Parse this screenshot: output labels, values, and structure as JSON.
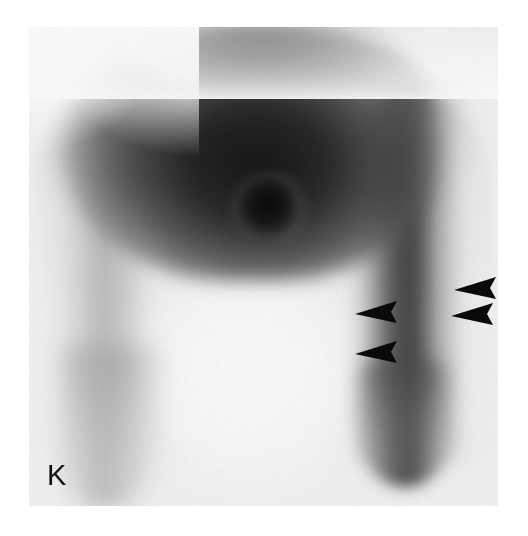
{
  "figure": {
    "panel_label": "K",
    "modality_appearance": "grayscale-scintigram",
    "background_color": "#ffffff",
    "field_background_color": "#f4f4f4",
    "ink_color": "#101010"
  },
  "scan_field": {
    "left": 29,
    "top": 27,
    "width": 469,
    "height": 479
  },
  "regions": [
    {
      "name": "upper-dark-mass",
      "description": "large high-uptake dome across the upper field",
      "center_x": 224,
      "center_y": 104,
      "intensity": "very-dark"
    },
    {
      "name": "focal-hot-spot",
      "description": "discrete focal high-uptake nodule below the dome",
      "center_x": 240,
      "center_y": 181,
      "intensity": "very-dark"
    },
    {
      "name": "right-vertical-band",
      "description": "prominent vertical band of increased activity along the right side",
      "center_x": 376,
      "center_y": 260,
      "intensity": "dark"
    },
    {
      "name": "left-diffuse-band",
      "description": "fainter vertical band of activity along the left side",
      "center_x": 76,
      "center_y": 285,
      "intensity": "medium"
    },
    {
      "name": "central-photopenic-column",
      "description": "low-activity central column in the lower half of the field",
      "center_x": 220,
      "center_y": 345,
      "intensity": "light"
    }
  ],
  "arrowheads": [
    {
      "id": "arrowhead-left-upper",
      "x": 356,
      "y": 305,
      "direction": "left",
      "size": 25,
      "color": "#0a0a0a"
    },
    {
      "id": "arrowhead-left-lower",
      "x": 356,
      "y": 345,
      "direction": "left",
      "size": 25,
      "color": "#0a0a0a"
    },
    {
      "id": "arrowhead-right-upper",
      "x": 455,
      "y": 281,
      "direction": "left",
      "size": 25,
      "color": "#0a0a0a"
    },
    {
      "id": "arrowhead-right-lower",
      "x": 452,
      "y": 307,
      "direction": "left",
      "size": 25,
      "color": "#0a0a0a"
    }
  ]
}
